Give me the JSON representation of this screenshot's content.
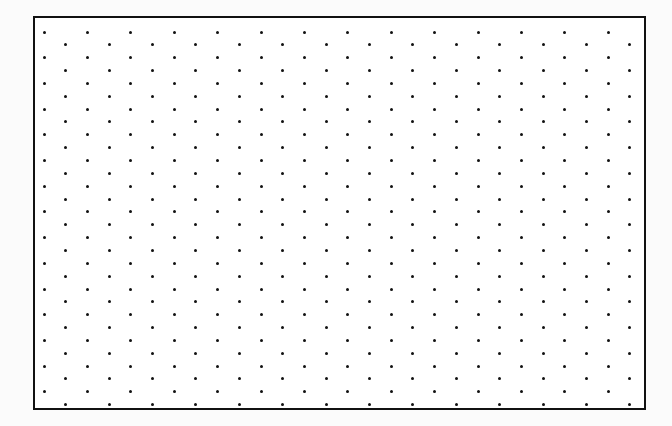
{
  "canvas": {
    "width": 672,
    "height": 426,
    "background_color": "#fbfbfb"
  },
  "frame": {
    "label": "dot grid frame",
    "x": 33,
    "y": 16,
    "width": 613,
    "height": 394,
    "border_width": 2,
    "border_color": "#111111",
    "fill_color": "#ffffff"
  },
  "chart_data": {
    "type": "scatter",
    "title": "",
    "subtitle": "",
    "xlabel": "",
    "ylabel": "",
    "grid": false,
    "legend_position": "none",
    "pattern": "staggered-offset-dot-lattice",
    "dot": {
      "color": "#111111",
      "diameter_px": 3,
      "shape": "circle"
    },
    "lattice": {
      "column_spacing_px": 43.4,
      "row_spacing_px": 12.85,
      "row_offset_px": 21.7,
      "origin_x_px": 9,
      "origin_y_px": 14,
      "columns": 15,
      "rows": 30,
      "offset_rows_columns": 14
    },
    "axis_ranges": {
      "xlim": [
        0,
        613
      ],
      "ylim": [
        0,
        394
      ]
    },
    "counts": {
      "even_row_dots_per_row": 15,
      "odd_row_dots_per_row": 14,
      "total_rows": 30,
      "approx_total_dots": 435
    }
  }
}
